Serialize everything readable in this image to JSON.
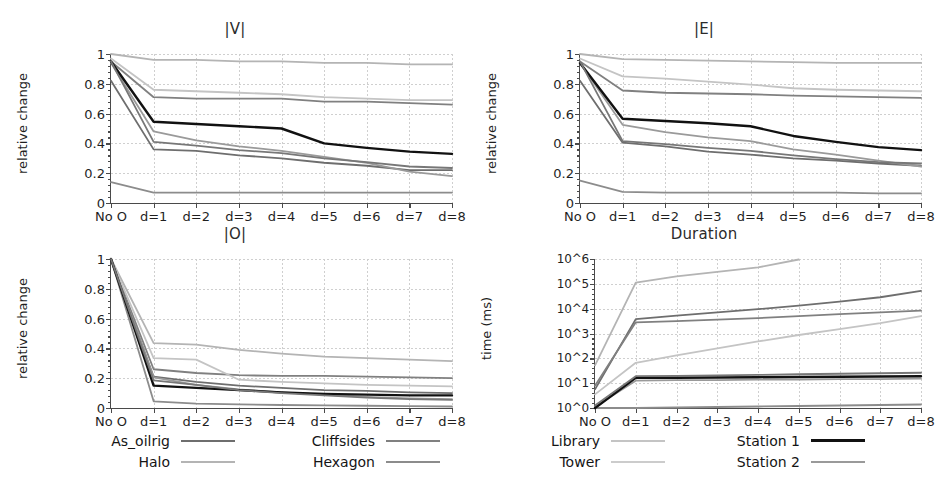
{
  "figure": {
    "width": 939,
    "height": 492,
    "background": "#ffffff"
  },
  "chart_data": [
    {
      "id": "panel-v",
      "type": "line",
      "title": "|V|",
      "xlabel": "",
      "ylabel": "relative change",
      "categories": [
        "No O",
        "d=1",
        "d=2",
        "d=3",
        "d=4",
        "d=5",
        "d=6",
        "d=7",
        "d=8"
      ],
      "ylim": [
        0,
        1
      ],
      "yticks": [
        0,
        0.2,
        0.4,
        0.6,
        0.8,
        1
      ],
      "ytick_labels": [
        "0",
        "0.2",
        "0.4",
        "0.6",
        "0.8",
        "1"
      ],
      "grid": true,
      "legend": "shared-bottom",
      "series": [
        {
          "name": "As_oilrig",
          "color": "#6e6e6e",
          "width": 1.8,
          "values": [
            0.82,
            0.36,
            0.35,
            0.32,
            0.3,
            0.27,
            0.25,
            0.22,
            0.22
          ]
        },
        {
          "name": "Halo",
          "color": "#b4b4b4",
          "width": 1.8,
          "values": [
            1.0,
            0.96,
            0.96,
            0.95,
            0.95,
            0.94,
            0.94,
            0.93,
            0.93
          ]
        },
        {
          "name": "Cliffsides",
          "color": "#808080",
          "width": 1.8,
          "values": [
            0.95,
            0.71,
            0.7,
            0.7,
            0.7,
            0.68,
            0.68,
            0.67,
            0.66
          ]
        },
        {
          "name": "Hexagon",
          "color": "#8c8c8c",
          "width": 1.8,
          "values": [
            0.14,
            0.07,
            0.07,
            0.07,
            0.07,
            0.07,
            0.07,
            0.07,
            0.07
          ]
        },
        {
          "name": "Library",
          "color": "#c4c4c4",
          "width": 1.8,
          "values": [
            0.97,
            0.76,
            0.75,
            0.74,
            0.73,
            0.71,
            0.7,
            0.69,
            0.69
          ]
        },
        {
          "name": "Tower",
          "color": "#9a9a9a",
          "width": 1.8,
          "values": [
            0.94,
            0.48,
            0.42,
            0.38,
            0.35,
            0.31,
            0.27,
            0.21,
            0.18
          ]
        },
        {
          "name": "Station 1",
          "color": "#111111",
          "width": 2.4,
          "values": [
            0.95,
            0.545,
            0.53,
            0.515,
            0.5,
            0.4,
            0.37,
            0.345,
            0.33
          ]
        },
        {
          "name": "Station 2",
          "color": "#777777",
          "width": 1.8,
          "values": [
            0.95,
            0.41,
            0.385,
            0.355,
            0.335,
            0.3,
            0.275,
            0.245,
            0.235
          ]
        }
      ]
    },
    {
      "id": "panel-e",
      "type": "line",
      "title": "|E|",
      "xlabel": "",
      "ylabel": "relative change",
      "categories": [
        "No O",
        "d=1",
        "d=2",
        "d=3",
        "d=4",
        "d=5",
        "d=6",
        "d=7",
        "d=8"
      ],
      "ylim": [
        0,
        1
      ],
      "yticks": [
        0,
        0.2,
        0.4,
        0.6,
        0.8,
        1
      ],
      "ytick_labels": [
        "0",
        "0.2",
        "0.4",
        "0.6",
        "0.8",
        "1"
      ],
      "grid": true,
      "legend": "shared-bottom",
      "series": [
        {
          "name": "As_oilrig",
          "color": "#6e6e6e",
          "width": 1.8,
          "values": [
            0.82,
            0.405,
            0.38,
            0.345,
            0.325,
            0.3,
            0.285,
            0.265,
            0.25
          ]
        },
        {
          "name": "Halo",
          "color": "#b4b4b4",
          "width": 1.8,
          "values": [
            1.0,
            0.965,
            0.96,
            0.955,
            0.95,
            0.945,
            0.94,
            0.94,
            0.94
          ]
        },
        {
          "name": "Cliffsides",
          "color": "#808080",
          "width": 1.8,
          "values": [
            0.95,
            0.755,
            0.74,
            0.735,
            0.73,
            0.72,
            0.715,
            0.71,
            0.705
          ]
        },
        {
          "name": "Hexagon",
          "color": "#8c8c8c",
          "width": 1.8,
          "values": [
            0.15,
            0.075,
            0.07,
            0.07,
            0.07,
            0.07,
            0.07,
            0.065,
            0.065
          ]
        },
        {
          "name": "Library",
          "color": "#c4c4c4",
          "width": 1.8,
          "values": [
            0.97,
            0.85,
            0.835,
            0.815,
            0.795,
            0.77,
            0.76,
            0.755,
            0.75
          ]
        },
        {
          "name": "Tower",
          "color": "#9a9a9a",
          "width": 1.8,
          "values": [
            0.94,
            0.525,
            0.475,
            0.44,
            0.415,
            0.36,
            0.325,
            0.285,
            0.245
          ]
        },
        {
          "name": "Station 1",
          "color": "#111111",
          "width": 2.4,
          "values": [
            0.94,
            0.565,
            0.55,
            0.535,
            0.515,
            0.45,
            0.41,
            0.375,
            0.355
          ]
        },
        {
          "name": "Station 2",
          "color": "#777777",
          "width": 1.8,
          "values": [
            0.95,
            0.415,
            0.395,
            0.37,
            0.35,
            0.32,
            0.295,
            0.275,
            0.265
          ]
        }
      ]
    },
    {
      "id": "panel-o",
      "type": "line",
      "title": "|O|",
      "xlabel": "",
      "ylabel": "relative change",
      "categories": [
        "No O",
        "d=1",
        "d=2",
        "d=3",
        "d=4",
        "d=5",
        "d=6",
        "d=7",
        "d=8"
      ],
      "ylim": [
        0,
        1
      ],
      "yticks": [
        0,
        0.2,
        0.4,
        0.6,
        0.8,
        1
      ],
      "ytick_labels": [
        "0",
        "0.2",
        "0.4",
        "0.6",
        "0.8",
        "1"
      ],
      "grid": true,
      "legend": "shared-bottom",
      "series": [
        {
          "name": "As_oilrig",
          "color": "#6e6e6e",
          "width": 1.8,
          "values": [
            1.0,
            0.21,
            0.175,
            0.15,
            0.135,
            0.12,
            0.115,
            0.105,
            0.1
          ]
        },
        {
          "name": "Halo",
          "color": "#b4b4b4",
          "width": 1.8,
          "values": [
            1.0,
            0.435,
            0.425,
            0.39,
            0.365,
            0.345,
            0.335,
            0.325,
            0.315
          ]
        },
        {
          "name": "Cliffsides",
          "color": "#808080",
          "width": 1.8,
          "values": [
            1.0,
            0.26,
            0.235,
            0.22,
            0.215,
            0.215,
            0.21,
            0.205,
            0.2
          ]
        },
        {
          "name": "Hexagon",
          "color": "#8c8c8c",
          "width": 1.8,
          "values": [
            1.0,
            0.045,
            0.03,
            0.025,
            0.02,
            0.018,
            0.015,
            0.012,
            0.01
          ]
        },
        {
          "name": "Library",
          "color": "#c4c4c4",
          "width": 1.8,
          "values": [
            1.0,
            0.335,
            0.325,
            0.19,
            0.175,
            0.165,
            0.155,
            0.15,
            0.145
          ]
        },
        {
          "name": "Tower",
          "color": "#9a9a9a",
          "width": 1.8,
          "values": [
            1.0,
            0.205,
            0.155,
            0.125,
            0.105,
            0.09,
            0.075,
            0.065,
            0.06
          ]
        },
        {
          "name": "Station 1",
          "color": "#111111",
          "width": 2.4,
          "values": [
            1.0,
            0.15,
            0.135,
            0.12,
            0.105,
            0.095,
            0.09,
            0.085,
            0.085
          ]
        },
        {
          "name": "Station 2",
          "color": "#777777",
          "width": 1.8,
          "values": [
            1.0,
            0.185,
            0.155,
            0.12,
            0.1,
            0.085,
            0.07,
            0.06,
            0.055
          ]
        }
      ]
    },
    {
      "id": "panel-duration",
      "type": "line",
      "title": "Duration",
      "xlabel": "",
      "ylabel": "time (ms)",
      "categories": [
        "No O",
        "d=1",
        "d=2",
        "d=3",
        "d=4",
        "d=5",
        "d=6",
        "d=7",
        "d=8"
      ],
      "yscale": "log",
      "ylim_exp": [
        0,
        6
      ],
      "yticks_exp": [
        0,
        1,
        2,
        3,
        4,
        5,
        6
      ],
      "ytick_labels": [
        "10^0",
        "10^1",
        "10^2",
        "10^3",
        "10^4",
        "10^5",
        "10^6"
      ],
      "grid": true,
      "legend": "shared-bottom",
      "series": [
        {
          "name": "As_oilrig",
          "color": "#6e6e6e",
          "width": 1.8,
          "values_exp": [
            0.75,
            3.58,
            3.72,
            3.85,
            3.98,
            4.12,
            4.28,
            4.46,
            4.72
          ]
        },
        {
          "name": "Halo",
          "color": "#b4b4b4",
          "width": 1.8,
          "values_exp": [
            1.72,
            5.05,
            5.3,
            5.48,
            5.66,
            5.98,
            null,
            null,
            null
          ]
        },
        {
          "name": "Cliffsides",
          "color": "#808080",
          "width": 1.8,
          "values_exp": [
            0.9,
            3.45,
            3.5,
            3.56,
            3.62,
            3.7,
            3.78,
            3.85,
            3.92
          ]
        },
        {
          "name": "Hexagon",
          "color": "#8c8c8c",
          "width": 1.8,
          "values_exp": [
            0.0,
            0.0,
            0.02,
            0.04,
            0.06,
            0.08,
            0.1,
            0.12,
            0.14
          ]
        },
        {
          "name": "Library",
          "color": "#c4c4c4",
          "width": 1.8,
          "values_exp": [
            0.55,
            1.82,
            2.12,
            2.4,
            2.68,
            2.94,
            3.18,
            3.42,
            3.7
          ]
        },
        {
          "name": "Tower",
          "color": "#9a9a9a",
          "width": 1.8,
          "values_exp": [
            0.05,
            1.1,
            1.12,
            1.12,
            1.14,
            1.14,
            1.16,
            1.16,
            1.18
          ]
        },
        {
          "name": "Station 1",
          "color": "#111111",
          "width": 2.4,
          "values_exp": [
            0.0,
            1.22,
            1.22,
            1.23,
            1.24,
            1.25,
            1.26,
            1.27,
            1.28
          ]
        },
        {
          "name": "Station 2",
          "color": "#777777",
          "width": 1.8,
          "values_exp": [
            0.1,
            1.28,
            1.29,
            1.31,
            1.33,
            1.36,
            1.38,
            1.4,
            1.42
          ]
        }
      ]
    }
  ],
  "legend": {
    "columns": [
      {
        "items": [
          {
            "label": "As_oilrig",
            "color": "#6e6e6e",
            "width": 2.0
          },
          {
            "label": "Halo",
            "color": "#b4b4b4",
            "width": 2.0
          }
        ]
      },
      {
        "items": [
          {
            "label": "Cliffsides",
            "color": "#808080",
            "width": 2.0
          },
          {
            "label": "Hexagon",
            "color": "#8c8c8c",
            "width": 2.0
          }
        ]
      },
      {
        "items": [
          {
            "label": "Library",
            "color": "#c4c4c4",
            "width": 2.0
          },
          {
            "label": "Tower",
            "color": "#cccccc",
            "width": 2.0
          }
        ]
      },
      {
        "items": [
          {
            "label": "Station 1",
            "color": "#111111",
            "width": 3.0
          },
          {
            "label": "Station 2",
            "color": "#9a9a9a",
            "width": 2.0
          }
        ]
      }
    ]
  }
}
